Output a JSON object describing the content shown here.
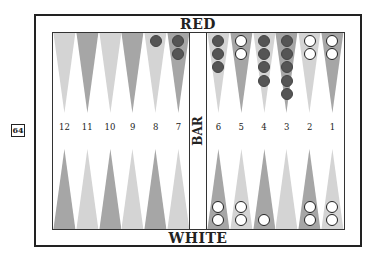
{
  "labels": {
    "top_player": "RED",
    "bottom_player": "WHITE",
    "bar": "BAR"
  },
  "cube": {
    "value": "64"
  },
  "colors": {
    "point_dark": "#a6a6a6",
    "point_light": "#d4d4d4",
    "red_checker": "#555555",
    "white_checker": "#ffffff",
    "border": "#222222"
  },
  "top_points": [
    {
      "number": "12",
      "shade": "light",
      "red": 0,
      "white": 0
    },
    {
      "number": "11",
      "shade": "dark",
      "red": 0,
      "white": 0
    },
    {
      "number": "10",
      "shade": "light",
      "red": 0,
      "white": 0
    },
    {
      "number": "9",
      "shade": "dark",
      "red": 0,
      "white": 0
    },
    {
      "number": "8",
      "shade": "light",
      "red": 1,
      "white": 0
    },
    {
      "number": "7",
      "shade": "dark",
      "red": 2,
      "white": 0
    },
    {
      "number": "6",
      "shade": "light",
      "red": 3,
      "white": 0
    },
    {
      "number": "5",
      "shade": "dark",
      "red": 0,
      "white": 2
    },
    {
      "number": "4",
      "shade": "light",
      "red": 4,
      "white": 0
    },
    {
      "number": "3",
      "shade": "dark",
      "red": 5,
      "white": 0
    },
    {
      "number": "2",
      "shade": "light",
      "red": 0,
      "white": 2
    },
    {
      "number": "1",
      "shade": "dark",
      "red": 0,
      "white": 2
    }
  ],
  "bottom_points": [
    {
      "column": "12",
      "shade": "dark",
      "red": 0,
      "white": 0
    },
    {
      "column": "11",
      "shade": "light",
      "red": 0,
      "white": 0
    },
    {
      "column": "10",
      "shade": "dark",
      "red": 0,
      "white": 0
    },
    {
      "column": "9",
      "shade": "light",
      "red": 0,
      "white": 0
    },
    {
      "column": "8",
      "shade": "dark",
      "red": 0,
      "white": 0
    },
    {
      "column": "7",
      "shade": "light",
      "red": 0,
      "white": 0
    },
    {
      "column": "6",
      "shade": "dark",
      "red": 0,
      "white": 2
    },
    {
      "column": "5",
      "shade": "light",
      "red": 0,
      "white": 2
    },
    {
      "column": "4",
      "shade": "dark",
      "red": 0,
      "white": 1
    },
    {
      "column": "3",
      "shade": "light",
      "red": 0,
      "white": 0
    },
    {
      "column": "2",
      "shade": "dark",
      "red": 0,
      "white": 2
    },
    {
      "column": "1",
      "shade": "light",
      "red": 0,
      "white": 2
    }
  ]
}
